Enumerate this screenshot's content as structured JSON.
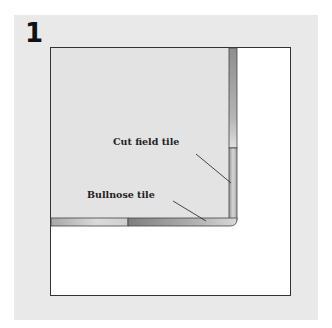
{
  "figure": {
    "step_number": "1",
    "labels": {
      "cut_field_tile": "Cut field tile",
      "bullnose_tile": "Bullnose tile"
    },
    "colors": {
      "panel_background": "#e9e9e9",
      "field_area": "#e3e3e3",
      "outline": "#333333",
      "tile_dark": "#8a8a8a",
      "tile_light": "#d4d4d4"
    }
  }
}
